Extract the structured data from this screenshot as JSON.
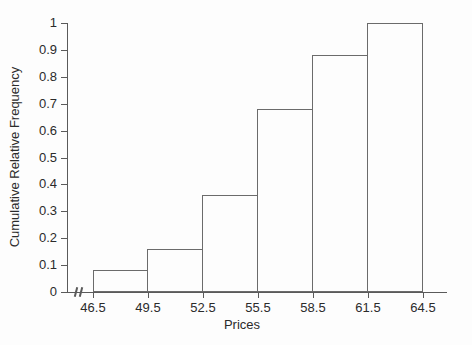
{
  "chart_data": {
    "type": "bar",
    "variant": "cumulative-relative-frequency-histogram",
    "title": "",
    "xlabel": "Prices",
    "ylabel": "Cumulative Relative Frequency",
    "bin_edges": [
      46.5,
      49.5,
      52.5,
      55.5,
      58.5,
      61.5,
      64.5
    ],
    "x_tick_labels": [
      "46.5",
      "49.5",
      "52.5",
      "55.5",
      "58.5",
      "61.5",
      "64.5"
    ],
    "values": [
      0.08,
      0.16,
      0.36,
      0.68,
      0.88,
      1.0
    ],
    "y_ticks": [
      0,
      0.1,
      0.2,
      0.3,
      0.4,
      0.5,
      0.6,
      0.7,
      0.8,
      0.9,
      1
    ],
    "y_tick_labels": [
      "0",
      "0.1",
      "0.2",
      "0.3",
      "0.4",
      "0.5",
      "0.6",
      "0.7",
      "0.8",
      "0.9",
      "1"
    ],
    "ylim": [
      0,
      1
    ],
    "grid": false,
    "legend": false,
    "axis_break_on_x": true,
    "colors": {
      "line": "#5a5a5a",
      "bar_outline": "#6b6b6b",
      "bar_fill": "#fdfdfd",
      "text": "#2b2b2b",
      "background": "#fdfdfd"
    }
  }
}
